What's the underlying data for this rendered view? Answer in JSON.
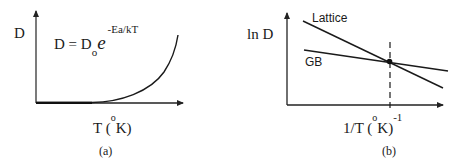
{
  "panel_a": {
    "caption": "(a)",
    "y_label": "D",
    "x_label_main": "T (",
    "x_label_sup": "o",
    "x_label_end": "K)",
    "equation": {
      "lhs": "D = D",
      "sub": "o",
      "base": "e",
      "exponent": "-Ea/kT"
    },
    "curve": "exponential rise of D with T"
  },
  "panel_b": {
    "caption": "(b)",
    "y_label": "ln D",
    "x_label_main": "1/T (",
    "x_label_sup": "o",
    "x_label_mid": "K)",
    "x_label_exp": "-1",
    "lines": [
      {
        "name": "Lattice",
        "label": "Lattice",
        "slope": "steep negative"
      },
      {
        "name": "GB",
        "label": "GB",
        "slope": "shallow negative"
      }
    ],
    "marker": "intersection point with dashed vertical line"
  },
  "colors": {
    "ink": "#1a1a1a",
    "axis": "#222222",
    "background": "#ffffff"
  }
}
